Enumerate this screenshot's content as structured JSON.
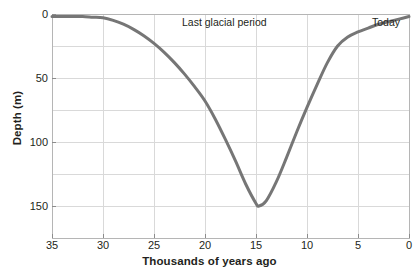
{
  "chart_data": {
    "type": "line",
    "title": "",
    "subtitle": "",
    "xlabel": "Thousands of years ago",
    "ylabel": "Depth (m)",
    "xlim": [
      35,
      0
    ],
    "ylim": [
      175,
      0
    ],
    "x_ticks": [
      35,
      30,
      25,
      20,
      15,
      10,
      5,
      0
    ],
    "y_ticks": [
      0,
      50,
      100,
      150
    ],
    "y_gridlines": [
      0,
      25,
      50,
      75,
      100,
      125,
      150,
      175
    ],
    "x_gridlines": [
      35,
      30,
      25,
      20,
      15,
      10,
      5,
      0
    ],
    "grid": true,
    "legend": "none",
    "axis_inverted_x": true,
    "axis_inverted_y": true,
    "line_color": "#767676",
    "line_width": 3,
    "series": [
      {
        "name": "Sea level depth below present",
        "x": [
          35,
          34,
          33,
          32,
          31,
          30,
          29,
          28,
          27,
          26,
          25,
          24,
          23,
          22,
          21,
          20,
          19,
          18,
          17,
          16,
          15,
          14.7,
          14,
          13,
          12,
          11,
          10,
          9,
          8,
          7,
          6,
          5,
          4,
          3,
          2,
          1,
          0
        ],
        "values": [
          2,
          2,
          2,
          2,
          2.5,
          3,
          5,
          8,
          12,
          17,
          23,
          30,
          38,
          47,
          57,
          68,
          82,
          98,
          115,
          133,
          148,
          150,
          146,
          131,
          112,
          92,
          73,
          55,
          38,
          25,
          18,
          14,
          11,
          8,
          6,
          4,
          2
        ]
      }
    ],
    "annotations": [
      {
        "text": "Last glacial period",
        "x": 18.5,
        "y": 8
      },
      {
        "text": "Today",
        "x": 1.6,
        "y": 8
      }
    ]
  },
  "axis": {
    "x_title": "Thousands of years ago",
    "y_title": "Depth (m)",
    "x_tick_labels": [
      "35",
      "30",
      "25",
      "20",
      "15",
      "10",
      "5",
      "0"
    ],
    "y_tick_labels": [
      "0",
      "50",
      "100",
      "150"
    ]
  },
  "annotations": {
    "glacial": "Last glacial period",
    "today": "Today"
  },
  "colors": {
    "line": "#767676",
    "grid": "#d9d9d9",
    "axis": "#b5b5b5",
    "text": "#231f20",
    "background": "#ffffff"
  }
}
